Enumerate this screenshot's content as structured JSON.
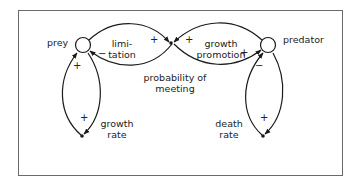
{
  "diagram": {
    "type": "causal-loop",
    "nodes": {
      "prey": {
        "label": "prey",
        "shape": "circle"
      },
      "predator": {
        "label": "predator",
        "shape": "circle"
      },
      "meeting": {
        "label_line1": "probability of",
        "label_line2": "meeting",
        "shape": "dot"
      },
      "growth_rate": {
        "label_line1": "growth",
        "label_line2": "rate",
        "shape": "dot"
      },
      "death_rate": {
        "label_line1": "death",
        "label_line2": "rate",
        "shape": "dot"
      }
    },
    "loop_labels": {
      "limitation_line1": "limi-",
      "limitation_line2": "tation",
      "growth_promotion_line1": "growth",
      "growth_promotion_line2": "promotion"
    },
    "links": [
      {
        "from": "prey",
        "to": "meeting",
        "sign": "+"
      },
      {
        "from": "meeting",
        "to": "prey",
        "sign": "−"
      },
      {
        "from": "meeting",
        "to": "predator",
        "sign": "+"
      },
      {
        "from": "predator",
        "to": "meeting",
        "sign": "+"
      },
      {
        "from": "growth_rate",
        "to": "prey",
        "sign": "+"
      },
      {
        "from": "prey",
        "to": "growth_rate",
        "sign": "+"
      },
      {
        "from": "death_rate",
        "to": "predator",
        "sign": "−"
      },
      {
        "from": "predator",
        "to": "death_rate",
        "sign": "+"
      }
    ],
    "signs": {
      "prey_to_meeting": "+",
      "meeting_to_prey": "−",
      "meeting_to_predator": "+",
      "predator_to_meeting": "+",
      "growth_to_prey": "+",
      "prey_to_growth": "+",
      "death_to_predator": "−",
      "predator_to_death": "+"
    },
    "colors": {
      "line": "#1a1a1a",
      "frame": "#6a6a6a",
      "background": "#ffffff"
    }
  }
}
